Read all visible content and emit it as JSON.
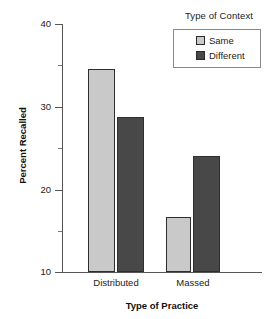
{
  "legend": {
    "title": "Type of Context",
    "entries": [
      {
        "label": "Same",
        "color": "#c9c9c9"
      },
      {
        "label": "Different",
        "color": "#484848"
      }
    ]
  },
  "axes": {
    "ylabel": "Percent Recalled",
    "xlabel": "Type of Practice",
    "ytick_labels": [
      "40",
      "30",
      "20",
      "10"
    ],
    "xtick_labels": [
      "Distributed",
      "Massed"
    ]
  },
  "chart_data": {
    "type": "bar",
    "title": "",
    "xlabel": "Type of Practice",
    "ylabel": "Percent Recalled",
    "categories": [
      "Distributed",
      "Massed"
    ],
    "series": [
      {
        "name": "Same",
        "color": "#c9c9c9",
        "values": [
          34.6,
          16.7
        ]
      },
      {
        "name": "Different",
        "color": "#484848",
        "values": [
          28.8,
          24.0
        ]
      }
    ],
    "ylim": [
      10,
      40
    ],
    "yticks": [
      10,
      20,
      30,
      40
    ],
    "yminorticks": [
      15,
      25,
      35
    ],
    "grid": false,
    "legend_title": "Type of Context",
    "legend_position": "top-right"
  }
}
